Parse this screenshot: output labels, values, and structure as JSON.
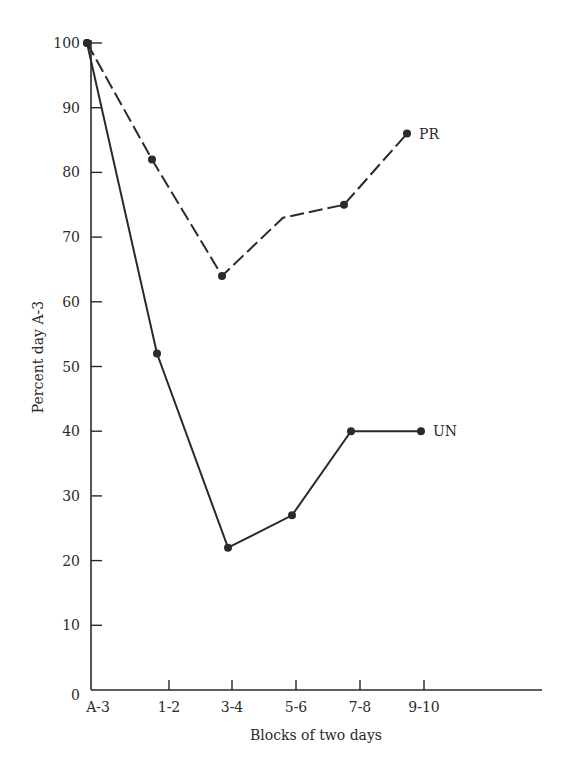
{
  "chart_data": {
    "type": "line",
    "title": "",
    "xlabel": "Blocks of two days",
    "ylabel": "Percent day A-3",
    "categories": [
      "A-3",
      "1-2",
      "3-4",
      "5-6",
      "7-8",
      "9-10"
    ],
    "yticks": [
      0,
      10,
      20,
      30,
      40,
      50,
      60,
      70,
      80,
      90,
      100
    ],
    "ylim": [
      0,
      100
    ],
    "grid": false,
    "legend": "inline labels at series ends",
    "series": [
      {
        "name": "PR",
        "style": "dashed",
        "values": [
          100,
          82,
          64,
          73,
          75,
          86
        ],
        "markers": [
          true,
          true,
          true,
          false,
          true,
          true
        ]
      },
      {
        "name": "UN",
        "style": "solid",
        "values": [
          100,
          52,
          22,
          27,
          40,
          40
        ],
        "markers": [
          true,
          true,
          true,
          true,
          true,
          true
        ]
      }
    ]
  },
  "colors": {
    "ink": "#2a2a2a",
    "background": "#ffffff"
  }
}
